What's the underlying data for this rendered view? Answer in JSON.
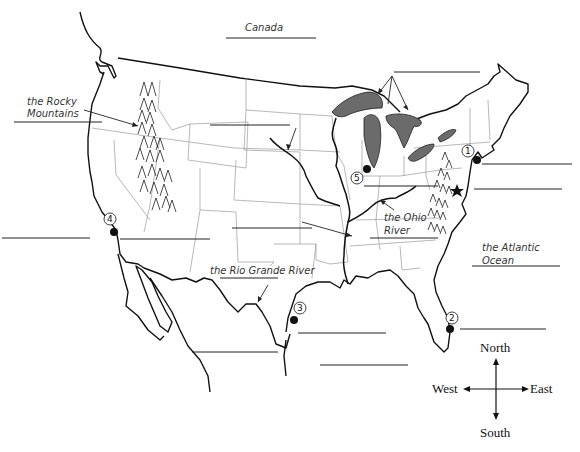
{
  "map": {
    "title": "United States outline map worksheet",
    "labels": {
      "canada": "Canada",
      "rocky_mountains_line1": "the Rocky",
      "rocky_mountains_line2": "Mountains",
      "rio_grande": "the Rio Grande River",
      "ohio_river_line1": "the Ohio",
      "ohio_river_line2": "River",
      "atlantic_line1": "the Atlantic",
      "atlantic_line2": "Ocean"
    },
    "markers": [
      {
        "number": "1",
        "place": "New York City area"
      },
      {
        "number": "2",
        "place": "Southeast Florida coast"
      },
      {
        "number": "3",
        "place": "Houston / Texas Gulf coast"
      },
      {
        "number": "4",
        "place": "Los Angeles area"
      },
      {
        "number": "5",
        "place": "Chicago area"
      }
    ],
    "capital_star": "Washington, D.C.",
    "blank_lines_count": 15
  },
  "compass": {
    "north": "North",
    "south": "South",
    "east": "East",
    "west": "West"
  }
}
